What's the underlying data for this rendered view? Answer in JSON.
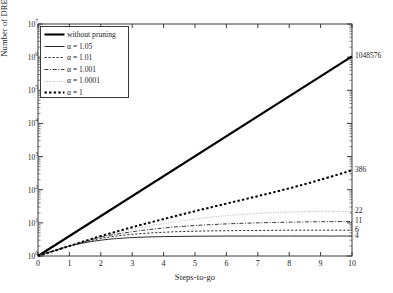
{
  "chart_data": {
    "type": "line",
    "title": "",
    "xlabel": "Steps-to-go",
    "ylabel": "Number of DRE solutions",
    "xlim": [
      0,
      10
    ],
    "ylim": [
      1,
      10000000
    ],
    "yscale": "log",
    "grid": false,
    "legend_position": "upper-left",
    "x": [
      0,
      1,
      2,
      3,
      4,
      5,
      6,
      7,
      8,
      9,
      10
    ],
    "series": [
      {
        "name": "without pruning",
        "style": "thick-solid",
        "end_label": "1048576",
        "values": [
          1,
          2,
          4,
          8,
          16,
          32,
          64,
          128,
          256,
          512,
          1048576
        ]
      },
      {
        "name": "α = 1.05",
        "style": "thin-solid",
        "end_label": "4",
        "values": [
          1,
          2,
          3,
          3.6,
          3.85,
          3.95,
          4,
          4,
          4,
          4,
          4
        ]
      },
      {
        "name": "α = 1.01",
        "style": "dotted",
        "end_label": "6",
        "values": [
          1,
          2,
          3.4,
          4.5,
          5.2,
          5.6,
          5.8,
          5.9,
          6,
          6,
          6
        ]
      },
      {
        "name": "α = 1.001",
        "style": "dash-dot",
        "end_label": "11",
        "values": [
          1,
          2,
          3.7,
          5.4,
          7,
          8.3,
          9.3,
          10,
          10.5,
          10.8,
          11
        ]
      },
      {
        "name": "α = 1.0001",
        "style": "fine-dotted",
        "end_label": "22",
        "values": [
          1,
          2,
          3.9,
          6.4,
          9.5,
          13,
          16.5,
          19.3,
          21.2,
          22.2,
          22
        ]
      },
      {
        "name": "α = 1",
        "style": "thick-dotted",
        "end_label": "386",
        "values": [
          1,
          2,
          4,
          7.4,
          13,
          22.5,
          38,
          64,
          110,
          200,
          386
        ]
      }
    ],
    "xticks": [
      "0",
      "1",
      "2",
      "3",
      "4",
      "5",
      "6",
      "7",
      "8",
      "9",
      "10"
    ],
    "yticks": [
      {
        "mantissa": "10",
        "exp": "0",
        "value": 1
      },
      {
        "mantissa": "10",
        "exp": "1",
        "value": 10
      },
      {
        "mantissa": "10",
        "exp": "2",
        "value": 100
      },
      {
        "mantissa": "10",
        "exp": "3",
        "value": 1000
      },
      {
        "mantissa": "10",
        "exp": "4",
        "value": 10000
      },
      {
        "mantissa": "10",
        "exp": "5",
        "value": 100000
      },
      {
        "mantissa": "10",
        "exp": "6",
        "value": 1000000
      },
      {
        "mantissa": "10",
        "exp": "7",
        "value": 10000000
      }
    ],
    "colors": {
      "axis": "#3a3a3a",
      "thick_solid": "#000000",
      "thin_solid": "#2b2b2b",
      "dotted": "#2b2b2b",
      "dash_dot": "#3a3a3a",
      "fine_dotted": "#b4b4b4",
      "thick_dotted": "#000000",
      "background": "#ffffff"
    }
  }
}
